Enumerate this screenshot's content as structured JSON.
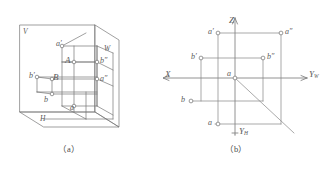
{
  "figure": {
    "stroke_color": "#6f6f6f",
    "point_fill": "#ffffff",
    "text_color": "#5a5a5a"
  },
  "panel_a": {
    "caption": "（a）",
    "plane_labels": {
      "v": "V",
      "w": "W",
      "h": "H"
    },
    "points": [
      {
        "id": "a-prime",
        "label": "a′",
        "x": 56,
        "y": 44
      },
      {
        "id": "A",
        "label": "A",
        "x": 66,
        "y": 60
      },
      {
        "id": "b-double-prime",
        "label": "b″",
        "x": 101,
        "y": 61
      },
      {
        "id": "b-front",
        "label": "b′",
        "x": 30,
        "y": 75
      },
      {
        "id": "B",
        "label": "B",
        "x": 48,
        "y": 77
      },
      {
        "id": "a-double-prime",
        "label": "a″",
        "x": 99,
        "y": 80
      },
      {
        "id": "b-plan",
        "label": "b",
        "x": 41,
        "y": 100
      },
      {
        "id": "a-plan",
        "label": "a",
        "x": 69,
        "y": 104
      }
    ]
  },
  "panel_b": {
    "caption": "（b）",
    "axes": {
      "z": "Z",
      "x": "X",
      "y_w": "Y",
      "y_w_sub": "W",
      "y_h": "Y",
      "y_h_sub": "H"
    },
    "points": [
      {
        "id": "a-prime",
        "label": "a′",
        "x": 48,
        "y": 32
      },
      {
        "id": "a-double-prime",
        "label": "a″",
        "x": 121,
        "y": 32
      },
      {
        "id": "b-prime",
        "label": "b′",
        "x": 30,
        "y": 57
      },
      {
        "id": "b-double-prime",
        "label": "b″",
        "x": 103,
        "y": 57
      },
      {
        "id": "origin",
        "label": "a",
        "x": 70,
        "y": 78
      },
      {
        "id": "b-plan",
        "label": "b",
        "x": 18,
        "y": 100
      },
      {
        "id": "a-plan",
        "label": "a",
        "x": 44,
        "y": 123
      }
    ]
  }
}
